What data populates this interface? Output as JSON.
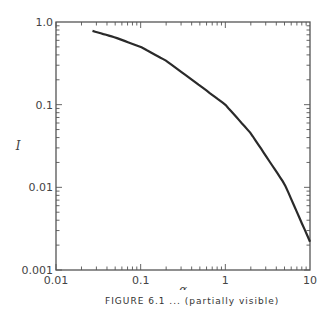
{
  "chart_data": {
    "type": "line",
    "title": "",
    "xlabel": "α",
    "ylabel": "I",
    "xscale": "log",
    "yscale": "log",
    "xlim": [
      0.01,
      10
    ],
    "ylim": [
      0.001,
      1.0
    ],
    "x_ticks": [
      "0.01",
      "0.1",
      "1",
      "10"
    ],
    "y_ticks": [
      "0.001",
      "0.01",
      "0.1",
      "1.0"
    ],
    "grid": false,
    "legend": null,
    "series": [
      {
        "name": "I(α)",
        "x": [
          0.027,
          0.05,
          0.1,
          0.2,
          0.5,
          1,
          2,
          5,
          10
        ],
        "y": [
          0.78,
          0.65,
          0.5,
          0.34,
          0.17,
          0.1,
          0.045,
          0.011,
          0.0022
        ]
      }
    ]
  },
  "caption": "FIGURE 6.1 ... (partially visible)"
}
